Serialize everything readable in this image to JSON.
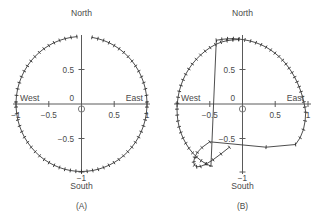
{
  "figure": {
    "background_color": "#ffffff",
    "line_color": "#3a3a3a",
    "axis_color": "#5a5a5a",
    "text_color": "#4a4a4a",
    "panels": [
      {
        "id": "A",
        "caption": "(A)",
        "compass": {
          "north": "North",
          "south": "South",
          "east": "East",
          "west": "West"
        },
        "x_ticks": [
          {
            "value": -1,
            "label": "−1"
          },
          {
            "value": -0.5,
            "label": "−0.5"
          },
          {
            "value": 0,
            "label": "0"
          },
          {
            "value": 0.5,
            "label": "0.5"
          },
          {
            "value": 1,
            "label": "1"
          }
        ],
        "y_ticks": [
          {
            "value": -1,
            "label": "−1"
          },
          {
            "value": -0.5,
            "label": "−0.5"
          },
          {
            "value": 0.5,
            "label": "0.5"
          },
          {
            "value": 1,
            "label": ""
          }
        ],
        "origin_label": "0"
      },
      {
        "id": "B",
        "caption": "(B)",
        "compass": {
          "north": "North",
          "south": "South",
          "east": "East",
          "west": "West"
        },
        "x_ticks": [
          {
            "value": -1,
            "label": ""
          },
          {
            "value": -0.5,
            "label": "−0.5"
          },
          {
            "value": 0,
            "label": "0"
          },
          {
            "value": 0.5,
            "label": "0.5"
          },
          {
            "value": 1,
            "label": "1"
          }
        ],
        "y_ticks": [
          {
            "value": -1,
            "label": "−1"
          },
          {
            "value": -0.5,
            "label": "−0.5"
          },
          {
            "value": 0.5,
            "label": "0.5"
          },
          {
            "value": 1,
            "label": ""
          }
        ],
        "origin_label": "0"
      }
    ]
  },
  "chart_data": [
    {
      "type": "line",
      "panel": "A",
      "title": "(A)",
      "xlabel": "",
      "ylabel": "",
      "xlim": [
        -1.08,
        1.08
      ],
      "ylim": [
        -1.08,
        1.08
      ],
      "grid": false,
      "legend": null,
      "annotations": [
        "North",
        "South",
        "East",
        "West",
        "(A)"
      ],
      "description": "Closed near-unit-circle trajectory with dense tick markers; small break in the trace just right of North",
      "series": [
        {
          "name": "trajectory-a",
          "marker": "tick",
          "x": [
            -0.07,
            -0.16,
            -0.25,
            -0.335,
            -0.42,
            -0.5,
            -0.575,
            -0.645,
            -0.712,
            -0.772,
            -0.826,
            -0.874,
            -0.915,
            -0.949,
            -0.975,
            -0.992,
            -1.0,
            -0.999,
            -0.99,
            -0.972,
            -0.946,
            -0.912,
            -0.871,
            -0.823,
            -0.768,
            -0.707,
            -0.641,
            -0.57,
            -0.496,
            -0.418,
            -0.337,
            -0.255,
            -0.171,
            -0.086,
            0.0,
            0.086,
            0.171,
            0.255,
            0.337,
            0.418,
            0.496,
            0.57,
            0.641,
            0.707,
            0.768,
            0.823,
            0.871,
            0.912,
            0.946,
            0.972,
            0.99,
            0.999,
            1.0,
            0.992,
            0.975,
            0.949,
            0.915,
            0.874,
            0.826,
            0.772,
            0.712,
            0.645,
            0.575,
            0.5,
            0.42,
            0.335,
            0.25,
            0.16
          ],
          "y": [
            0.998,
            0.987,
            0.968,
            0.942,
            0.908,
            0.866,
            0.818,
            0.764,
            0.702,
            0.636,
            0.564,
            0.486,
            0.404,
            0.316,
            0.224,
            0.128,
            0.03,
            -0.046,
            -0.143,
            -0.236,
            -0.325,
            -0.41,
            -0.492,
            -0.568,
            -0.64,
            -0.707,
            -0.768,
            -0.822,
            -0.868,
            -0.908,
            -0.941,
            -0.967,
            -0.985,
            -0.996,
            -1.0,
            -0.996,
            -0.985,
            -0.967,
            -0.941,
            -0.908,
            -0.868,
            -0.822,
            -0.768,
            -0.707,
            -0.64,
            -0.568,
            -0.492,
            -0.41,
            -0.325,
            -0.236,
            -0.143,
            -0.046,
            0.03,
            0.128,
            0.224,
            0.316,
            0.404,
            0.486,
            0.564,
            0.636,
            0.702,
            0.764,
            0.818,
            0.866,
            0.908,
            0.942,
            0.968,
            0.987
          ],
          "break_after_index": 67
        }
      ]
    },
    {
      "type": "line",
      "panel": "B",
      "title": "(B)",
      "xlabel": "",
      "ylabel": "",
      "xlim": [
        -1.08,
        1.08
      ],
      "ylim": [
        -1.08,
        1.08
      ],
      "grid": false,
      "legend": null,
      "annotations": [
        "North",
        "South",
        "East",
        "West",
        "(B)"
      ],
      "description": "Distorted unit-circle trajectory: smooth dense arc across the top and right, a straight chord cutting the upper-left, a long straight chord across the lower middle, a polygonal sparse segment at lower right, and an inward spiral tail ending near (-0.62,-0.92)",
      "series": [
        {
          "name": "trajectory-b",
          "marker": "tick",
          "x": [
            -0.06,
            -0.15,
            -0.24,
            -0.33,
            -0.415,
            -0.495,
            -0.57,
            -0.64,
            -0.706,
            -0.766,
            -0.82,
            -0.868,
            -0.908,
            -0.94,
            -0.966,
            -0.984,
            -0.995,
            -1.0,
            -0.996,
            -0.986,
            -0.968,
            -0.942,
            -0.908,
            -0.866,
            -0.818,
            -0.762,
            -0.7,
            -0.632,
            -0.56,
            -0.482,
            -0.4,
            -0.315,
            -0.228,
            -0.14,
            -0.052,
            0.036,
            0.122,
            0.205,
            0.285,
            0.36,
            0.43,
            0.495,
            0.556,
            0.612,
            0.664,
            0.712,
            0.756,
            0.796,
            0.832,
            0.864,
            0.892,
            0.916,
            0.936,
            0.952,
            0.965,
            0.956,
            0.93,
            0.88,
            0.81,
            0.36,
            -0.5,
            -0.62,
            -0.69,
            -0.73,
            -0.745,
            -0.735,
            -0.7,
            -0.64,
            -0.555,
            -0.45,
            -0.33,
            -0.2
          ],
          "y": [
            0.955,
            0.95,
            0.938,
            0.915,
            0.88,
            0.836,
            0.784,
            0.726,
            0.662,
            0.592,
            0.518,
            0.44,
            0.358,
            0.274,
            0.188,
            0.1,
            0.012,
            -0.076,
            -0.164,
            -0.252,
            -0.338,
            -0.422,
            -0.504,
            -0.582,
            -0.656,
            -0.724,
            -0.786,
            -0.84,
            -0.885,
            -0.92,
            0.944,
            0.958,
            0.966,
            0.968,
            0.962,
            0.95,
            0.932,
            0.908,
            0.878,
            0.842,
            0.8,
            0.754,
            0.704,
            0.65,
            0.592,
            0.53,
            0.466,
            0.398,
            0.328,
            0.256,
            0.182,
            0.106,
            0.03,
            -0.046,
            -0.122,
            -0.25,
            -0.38,
            -0.5,
            -0.6,
            -0.64,
            -0.56,
            -0.645,
            -0.718,
            -0.79,
            -0.858,
            -0.905,
            -0.93,
            -0.925,
            -0.89,
            -0.826,
            -0.74,
            -0.64
          ]
        }
      ]
    }
  ]
}
